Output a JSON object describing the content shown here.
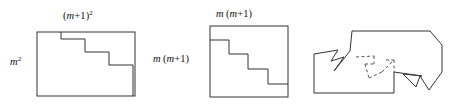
{
  "figure": {
    "background_color": "#ffffff",
    "stroke_color": "#333333",
    "dashed_stroke_color": "#555555",
    "panel_count": 3
  },
  "panels": [
    {
      "id": "panel-1",
      "name": "squared-rectangle-panel",
      "labels": {
        "top": {
          "text": "(m+1)²",
          "parts": {
            "open": "(",
            "var": "m",
            "plus": "+1)",
            "exponent": "2"
          }
        },
        "left": {
          "text": "m²",
          "parts": {
            "var": "m",
            "exponent": "2"
          }
        }
      },
      "shape": {
        "type": "rectangle-with-staircase",
        "steps": 4,
        "rect": {
          "x": 37,
          "y": 32,
          "width": 98,
          "height": 64
        }
      }
    },
    {
      "id": "panel-2",
      "name": "product-square-panel",
      "labels": {
        "top": {
          "text": "m(m+1)",
          "parts": {
            "var1": "m",
            "open": "(",
            "var2": "m",
            "plus": "+1)"
          }
        },
        "left": {
          "text": "m(m+1)",
          "parts": {
            "var1": "m",
            "open": "(",
            "var2": "m",
            "plus": "+1)"
          }
        }
      },
      "shape": {
        "type": "square-with-staircase",
        "steps": 4,
        "rect": {
          "x": 60,
          "y": 26,
          "width": 78,
          "height": 71
        }
      }
    },
    {
      "id": "panel-3",
      "name": "interlocked-assembly-panel",
      "labels": {},
      "shape": {
        "type": "interlocked-polygon-with-dashed-seam",
        "has_dashed_seam": true,
        "notch_count": 2
      }
    }
  ]
}
